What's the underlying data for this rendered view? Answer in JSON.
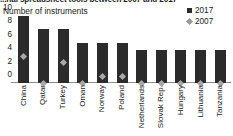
{
  "title": "...nal spreadsheet tools between 2007 and 2017",
  "axis_caption": "Number of instruments",
  "legend": {
    "position": "top-right",
    "entries": [
      {
        "label": "2017",
        "marker": "square",
        "color": "#2b2b2b"
      },
      {
        "label": "2007",
        "marker": "diamond",
        "color": "#a8a8a8"
      }
    ]
  },
  "chart_data": {
    "type": "bar",
    "title": "...nal spreadsheet tools between 2007 and 2017",
    "xlabel": "",
    "ylabel": "Number of instruments",
    "ylim": [
      0,
      10
    ],
    "yticks": [
      0,
      2,
      4,
      6,
      8,
      10
    ],
    "grid": false,
    "legend_position": "top-right",
    "categories": [
      "China",
      "Qatar",
      "Turkey",
      "Oman",
      "Norway",
      "Poland",
      "Netherlands",
      "Slovak Rep.",
      "Hungary",
      "Lithuania",
      "Tanzania"
    ],
    "series": [
      {
        "name": "2017",
        "type": "bar",
        "color": "#2b2b2b",
        "values": [
          10,
          8,
          8,
          6,
          6,
          6,
          5,
          5,
          5,
          5,
          5
        ]
      },
      {
        "name": "2007",
        "type": "marker",
        "marker": "diamond",
        "color": "#a8a8a8",
        "values": [
          4,
          0,
          3,
          0,
          1,
          1,
          0,
          0,
          0,
          0,
          0
        ]
      }
    ]
  }
}
